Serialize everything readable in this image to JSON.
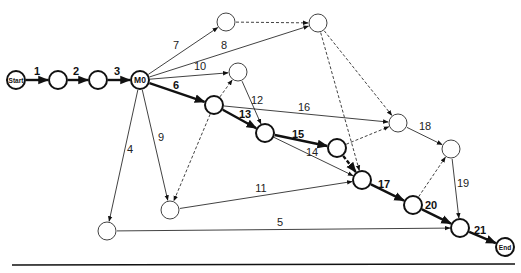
{
  "diagram": {
    "type": "activity-on-arrow network",
    "nodes": [
      {
        "id": "start",
        "label": "Start",
        "x": 16,
        "y": 80,
        "r": 9,
        "bold": true
      },
      {
        "id": "a",
        "label": "",
        "x": 58,
        "y": 80,
        "r": 9,
        "bold": true
      },
      {
        "id": "b",
        "label": "",
        "x": 98,
        "y": 80,
        "r": 9,
        "bold": true
      },
      {
        "id": "m0",
        "label": "M0",
        "x": 140,
        "y": 80,
        "r": 9,
        "bold": true
      },
      {
        "id": "t1",
        "label": "",
        "x": 226,
        "y": 22,
        "r": 9,
        "bold": false
      },
      {
        "id": "t2",
        "label": "",
        "x": 318,
        "y": 23,
        "r": 9,
        "bold": false
      },
      {
        "id": "n10",
        "label": "",
        "x": 238,
        "y": 72,
        "r": 9,
        "bold": false
      },
      {
        "id": "n6",
        "label": "",
        "x": 214,
        "y": 105,
        "r": 9,
        "bold": true
      },
      {
        "id": "n13",
        "label": "",
        "x": 265,
        "y": 133,
        "r": 9,
        "bold": true
      },
      {
        "id": "n15",
        "label": "",
        "x": 337,
        "y": 148,
        "r": 9,
        "bold": true
      },
      {
        "id": "n17",
        "label": "",
        "x": 362,
        "y": 180,
        "r": 9,
        "bold": true
      },
      {
        "id": "n16",
        "label": "",
        "x": 398,
        "y": 123,
        "r": 9,
        "bold": false
      },
      {
        "id": "n18",
        "label": "",
        "x": 451,
        "y": 149,
        "r": 9,
        "bold": false
      },
      {
        "id": "n20",
        "label": "",
        "x": 413,
        "y": 205,
        "r": 9,
        "bold": true
      },
      {
        "id": "n21",
        "label": "",
        "x": 460,
        "y": 228,
        "r": 9,
        "bold": true
      },
      {
        "id": "end",
        "label": "End",
        "x": 505,
        "y": 247,
        "r": 9,
        "bold": true
      },
      {
        "id": "n9",
        "label": "",
        "x": 170,
        "y": 210,
        "r": 9,
        "bold": false
      },
      {
        "id": "n4",
        "label": "",
        "x": 107,
        "y": 231,
        "r": 9,
        "bold": false
      }
    ],
    "edges": [
      {
        "from": "start",
        "to": "a",
        "label": "1",
        "style": "critical",
        "lx": 37,
        "ly": 75
      },
      {
        "from": "a",
        "to": "b",
        "label": "2",
        "style": "critical",
        "lx": 76,
        "ly": 75
      },
      {
        "from": "b",
        "to": "m0",
        "label": "3",
        "style": "critical",
        "lx": 117,
        "ly": 75
      },
      {
        "from": "m0",
        "to": "t1",
        "label": "7",
        "style": "normal",
        "lx": 176,
        "ly": 49
      },
      {
        "from": "m0",
        "to": "t2",
        "label": "8",
        "style": "normal",
        "lx": 224,
        "ly": 49
      },
      {
        "from": "m0",
        "to": "n10",
        "label": "10",
        "style": "normal",
        "lx": 200,
        "ly": 70
      },
      {
        "from": "m0",
        "to": "n6",
        "label": "6",
        "style": "critical",
        "lx": 176,
        "ly": 89
      },
      {
        "from": "m0",
        "to": "n4",
        "label": "4",
        "style": "normal",
        "lx": 130,
        "ly": 153
      },
      {
        "from": "m0",
        "to": "n9",
        "label": "9",
        "style": "normal",
        "lx": 161,
        "ly": 141
      },
      {
        "from": "t1",
        "to": "t2",
        "label": "",
        "style": "dummy"
      },
      {
        "from": "t2",
        "to": "n17",
        "label": "",
        "style": "dummy"
      },
      {
        "from": "t2",
        "to": "n16",
        "label": "",
        "style": "dummy"
      },
      {
        "from": "n6",
        "to": "n10",
        "label": "",
        "style": "dummy"
      },
      {
        "from": "n6",
        "to": "n9",
        "label": "",
        "style": "dummy"
      },
      {
        "from": "n10",
        "to": "n13",
        "label": "12",
        "style": "normal",
        "lx": 257,
        "ly": 104
      },
      {
        "from": "n6",
        "to": "n13",
        "label": "13",
        "style": "critical",
        "lx": 245,
        "ly": 118
      },
      {
        "from": "n6",
        "to": "n16",
        "label": "16",
        "style": "normal",
        "lx": 304,
        "ly": 111
      },
      {
        "from": "n13",
        "to": "n15",
        "label": "15",
        "style": "critical",
        "lx": 298,
        "ly": 138
      },
      {
        "from": "n13",
        "to": "n17",
        "label": "14",
        "style": "normal",
        "lx": 312,
        "ly": 156
      },
      {
        "from": "n15",
        "to": "n17",
        "label": "",
        "style": "critical-dummy"
      },
      {
        "from": "n15",
        "to": "n16",
        "label": "",
        "style": "dummy"
      },
      {
        "from": "n9",
        "to": "n17",
        "label": "11",
        "style": "normal",
        "lx": 261,
        "ly": 192
      },
      {
        "from": "n16",
        "to": "n18",
        "label": "18",
        "style": "normal",
        "lx": 425,
        "ly": 130
      },
      {
        "from": "n17",
        "to": "n20",
        "label": "17",
        "style": "critical",
        "lx": 384,
        "ly": 188
      },
      {
        "from": "n20",
        "to": "n18",
        "label": "",
        "style": "dummy"
      },
      {
        "from": "n18",
        "to": "n21",
        "label": "19",
        "style": "normal",
        "lx": 463,
        "ly": 187
      },
      {
        "from": "n20",
        "to": "n21",
        "label": "20",
        "style": "critical",
        "lx": 431,
        "ly": 209
      },
      {
        "from": "n4",
        "to": "n21",
        "label": "5",
        "style": "normal",
        "lx": 280,
        "ly": 226
      },
      {
        "from": "n21",
        "to": "end",
        "label": "21",
        "style": "critical",
        "lx": 480,
        "ly": 234
      }
    ],
    "baseline": {
      "x1": 12,
      "y1": 265,
      "x2": 515,
      "y2": 264
    }
  }
}
